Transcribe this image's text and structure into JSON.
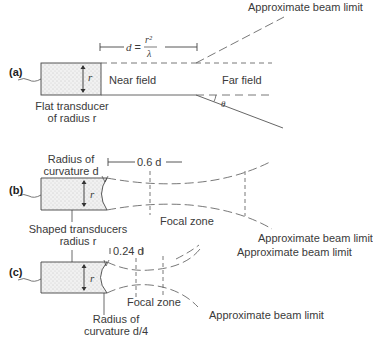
{
  "diagram": {
    "type": "ultrasound beam profiles",
    "panels": [
      {
        "id": "a",
        "panel_label": "(a)",
        "transducer_label_line1": "Flat transducer",
        "transducer_label_line2": "of radius r",
        "radius_symbol": "r",
        "dimension_label_prefix": "d =",
        "dimension_numerator": "r²",
        "dimension_denominator": "λ",
        "near_field_label": "Near field",
        "far_field_label": "Far field",
        "angle_label": "θ",
        "beam_limit_label": "Approximate beam limit"
      },
      {
        "id": "b",
        "panel_label": "(b)",
        "curvature_label_line1": "Radius of",
        "curvature_label_line2": "curvature d",
        "radius_symbol": "r",
        "dimension_label": "0.6 d",
        "focal_zone_label": "Focal zone",
        "beam_limit_label": "Approximate beam limit"
      },
      {
        "id": "c",
        "panel_label": "(c)",
        "shared_label_line1": "Shaped transducers",
        "shared_label_line2": "radius r",
        "radius_symbol": "r",
        "dimension_label": "0.24 d",
        "focal_zone_label": "Focal zone",
        "curvature_label_line1": "Radius of",
        "curvature_label_line2": "curvature d/4",
        "beam_limit_top_label": "Approximate beam limit",
        "beam_limit_bottom_label": "Approximate beam limit"
      }
    ],
    "colors": {
      "line": "#555555",
      "transducer_fill": "#ececec",
      "text": "#3a3a3a"
    }
  }
}
